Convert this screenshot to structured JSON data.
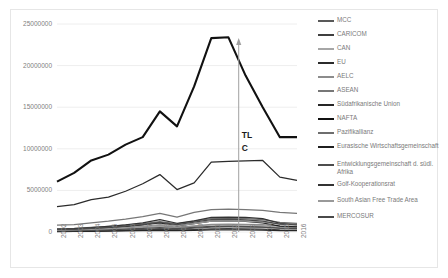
{
  "chart_data": {
    "type": "line",
    "title": "",
    "xlabel": "",
    "ylabel": "",
    "x": [
      2002,
      2003,
      2004,
      2005,
      2006,
      2007,
      2008,
      2009,
      2010,
      2011,
      2012,
      2013,
      2014,
      2015,
      2016
    ],
    "categories": [
      "2002",
      "2003",
      "2004",
      "2005",
      "2006",
      "2007",
      "2008",
      "2009",
      "2010",
      "2011",
      "2012",
      "2013",
      "2014",
      "2015",
      "2016"
    ],
    "ylim": [
      0,
      25000000
    ],
    "yticks": [
      0,
      5000000,
      10000000,
      15000000,
      20000000,
      25000000
    ],
    "ytick_labels": [
      "0",
      "5000000",
      "10000000",
      "15000000",
      "20000000",
      "25000000"
    ],
    "grid": true,
    "legend_position": "right",
    "annotations": [
      {
        "text": "TL",
        "x": 2013,
        "y": 12600000
      },
      {
        "text": "C",
        "x": 2013,
        "y": 11000000
      },
      {
        "text": "arrow-marker",
        "x": 2012.6,
        "y": 23000000
      }
    ],
    "series": [
      {
        "name": "MCC",
        "color": "#595959",
        "values": [
          120000,
          140000,
          165000,
          200000,
          250000,
          330000,
          420000,
          330000,
          470000,
          600000,
          620000,
          600000,
          580000,
          470000,
          430000
        ]
      },
      {
        "name": "CARICOM",
        "color": "#3f3f3f",
        "values": [
          90000,
          100000,
          120000,
          150000,
          190000,
          240000,
          310000,
          230000,
          300000,
          380000,
          400000,
          380000,
          350000,
          260000,
          230000
        ]
      },
      {
        "name": "CAN",
        "color": "#a6a6a6",
        "values": [
          180000,
          200000,
          260000,
          330000,
          420000,
          520000,
          680000,
          520000,
          680000,
          850000,
          900000,
          860000,
          780000,
          570000,
          500000
        ]
      },
      {
        "name": "EU",
        "color": "#2b2b2b",
        "values": [
          3050000,
          3300000,
          3900000,
          4200000,
          4900000,
          5800000,
          6900000,
          5100000,
          5900000,
          8400000,
          8500000,
          8550000,
          8600000,
          6600000,
          6200000
        ]
      },
      {
        "name": "AELC",
        "color": "#8c8c8c",
        "values": [
          260000,
          300000,
          360000,
          420000,
          520000,
          640000,
          800000,
          600000,
          740000,
          920000,
          960000,
          930000,
          880000,
          700000,
          650000
        ]
      },
      {
        "name": "ASEAN",
        "color": "#777777",
        "values": [
          820000,
          900000,
          1100000,
          1300000,
          1550000,
          1850000,
          2250000,
          1800000,
          2350000,
          2700000,
          2750000,
          2700000,
          2600000,
          2350000,
          2250000
        ]
      },
      {
        "name": "Südafrikanische Union",
        "color": "#262626",
        "values": [
          60000,
          70000,
          85000,
          105000,
          130000,
          165000,
          205000,
          160000,
          210000,
          250000,
          255000,
          245000,
          225000,
          175000,
          165000
        ]
      },
      {
        "name": "NAFTA",
        "color": "#111111",
        "values": [
          6050000,
          7100000,
          8600000,
          9300000,
          10500000,
          11400000,
          14500000,
          12700000,
          17500000,
          23300000,
          23400000,
          18800000,
          15000000,
          11400000,
          11400000
        ]
      },
      {
        "name": "Pazifikallianz",
        "color": "#6e6e6e",
        "values": [
          410000,
          450000,
          560000,
          680000,
          830000,
          1000000,
          1250000,
          980000,
          1300000,
          1600000,
          1650000,
          1600000,
          1500000,
          1150000,
          1050000
        ]
      },
      {
        "name": "Eurasische Wirtschaftsgemeinschaft",
        "color": "#1f1f1f",
        "values": [
          230000,
          290000,
          380000,
          500000,
          650000,
          850000,
          1100000,
          750000,
          1000000,
          1300000,
          1350000,
          1280000,
          1100000,
          700000,
          620000
        ]
      },
      {
        "name": "Entwicklungsgemeinschaft d. südl. Afrika",
        "color": "#4d4d4d",
        "values": [
          150000,
          175000,
          215000,
          270000,
          340000,
          430000,
          540000,
          420000,
          550000,
          680000,
          700000,
          670000,
          600000,
          460000,
          420000
        ]
      },
      {
        "name": "Golf-Kooperationsrat",
        "color": "#333333",
        "values": [
          330000,
          400000,
          520000,
          690000,
          870000,
          1100000,
          1500000,
          1050000,
          1350000,
          1750000,
          1800000,
          1750000,
          1600000,
          1050000,
          900000
        ]
      },
      {
        "name": "South Asian Free Trade Area",
        "color": "#999999",
        "values": [
          210000,
          250000,
          320000,
          420000,
          540000,
          690000,
          900000,
          760000,
          1000000,
          1300000,
          1350000,
          1300000,
          1200000,
          950000,
          880000
        ]
      },
      {
        "name": "MERCOSUR",
        "color": "#4a4a4a",
        "values": [
          290000,
          330000,
          430000,
          550000,
          700000,
          880000,
          1150000,
          900000,
          1200000,
          1500000,
          1550000,
          1450000,
          1300000,
          950000,
          850000
        ]
      }
    ]
  },
  "legend": {
    "items": [
      {
        "label": "MCC"
      },
      {
        "label": "CARICOM"
      },
      {
        "label": "CAN"
      },
      {
        "label": "EU"
      },
      {
        "label": "AELC"
      },
      {
        "label": "ASEAN"
      },
      {
        "label": "Südafrikanische Union"
      },
      {
        "label": "NAFTA"
      },
      {
        "label": "Pazifikallianz"
      },
      {
        "label": "Eurasische Wirtschaftsgemeinschaft"
      },
      {
        "label": "Entwicklungsgemeinschaft d. südl. Afrika"
      },
      {
        "label": "Golf-Kooperationsrat"
      },
      {
        "label": "South Asian Free Trade Area"
      },
      {
        "label": "MERCOSUR"
      }
    ]
  },
  "annotation_text": {
    "line1": "TL",
    "line2": "C"
  },
  "colors": {
    "grid": "#eeeeee",
    "axis_text": "#808080",
    "frame": "#e6e6e6",
    "annotation": "#1a1a1a",
    "marker_line": "#a0a0a0"
  }
}
